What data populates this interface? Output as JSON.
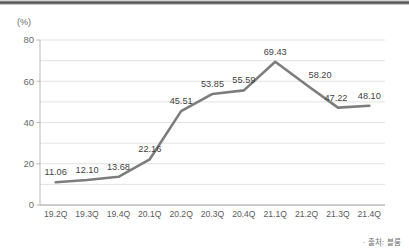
{
  "decor": {
    "top_bar_color": "#4a4a4a"
  },
  "footer": {
    "source_note": "· 출처: 블룸"
  },
  "chart_data": {
    "type": "line",
    "title": "",
    "subtitle": "",
    "xlabel": "",
    "ylabel": "",
    "unit_label": "(%)",
    "categories": [
      "19.2Q",
      "19.3Q",
      "19.4Q",
      "20.1Q",
      "20.2Q",
      "20.3Q",
      "20.4Q",
      "21.1Q",
      "21.2Q",
      "21.3Q",
      "21.4Q"
    ],
    "values": [
      11.06,
      12.1,
      13.68,
      22.16,
      45.51,
      53.85,
      55.59,
      69.43,
      58.2,
      47.22,
      48.1
    ],
    "data_labels": [
      "11.06",
      "12.10",
      "13.68",
      "22.16",
      "45.51",
      "53.85",
      "55.59",
      "69.43",
      "58.20",
      "47.22",
      "48.10"
    ],
    "ylim": [
      0,
      80
    ],
    "ytick_labels": [
      "0",
      "20",
      "40",
      "60",
      "80"
    ],
    "ytick_values": [
      0,
      20,
      40,
      60,
      80
    ],
    "minor_gridline_values": [
      10,
      30,
      50,
      70
    ],
    "grid": true,
    "legend": "none",
    "series_color": "#7d7d7d",
    "grid_color": "#e2e2e2",
    "axis_color": "#b9b9b9"
  }
}
